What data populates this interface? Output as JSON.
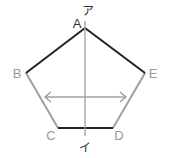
{
  "diagram": {
    "title": "",
    "vertices": [
      {
        "label": "A",
        "x": 85,
        "y": 28
      },
      {
        "label": "B",
        "x": 26,
        "y": 73
      },
      {
        "label": "C",
        "x": 58,
        "y": 128
      },
      {
        "label": "D",
        "x": 113,
        "y": 128
      },
      {
        "label": "E",
        "x": 145,
        "y": 73
      }
    ],
    "axis": {
      "top_label": "ア",
      "bottom_label": "イ"
    },
    "colors": {
      "dark": "#222222",
      "gray": "#a0a0a0",
      "label": "#999999"
    }
  }
}
